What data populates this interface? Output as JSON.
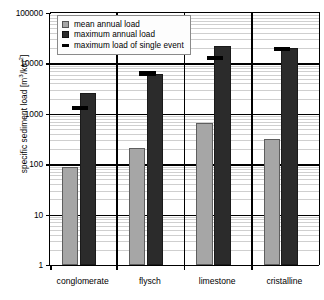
{
  "chart_data": {
    "type": "bar",
    "title": "",
    "xlabel": "",
    "ylabel": "specific sediment load [m3/km2]",
    "ylabel_base": "specific sediment load [m",
    "ylabel_sup1": "3",
    "ylabel_mid": "/km",
    "ylabel_sup2": "2",
    "ylabel_end": "]",
    "yscale": "log",
    "ylim": [
      1,
      100000
    ],
    "ytick_labels": [
      "100000",
      "10000",
      "1000",
      "100",
      "10",
      "1"
    ],
    "ytick_values": [
      100000,
      10000,
      1000,
      100,
      10,
      1
    ],
    "grid": "horizontal-log-minor",
    "legend_position": "top-left",
    "categories": [
      "conglomerate",
      "flysch",
      "limestone",
      "cristalline"
    ],
    "series": [
      {
        "name": "mean annual load",
        "type": "bar",
        "color": "#a6a6a6",
        "values": [
          90,
          210,
          650,
          320
        ]
      },
      {
        "name": "maximum annual load",
        "type": "bar",
        "color": "#2b2b2b",
        "values": [
          2600,
          6100,
          22000,
          20000
        ]
      },
      {
        "name": "maximum load of single event",
        "type": "marker",
        "color": "#000000",
        "values": [
          1300,
          6300,
          13000,
          19000
        ]
      }
    ]
  },
  "legend": {
    "items": [
      {
        "label": "mean annual load",
        "swatch": "gray-square-swatch"
      },
      {
        "label": "maximum annual load",
        "swatch": "dark-square-swatch"
      },
      {
        "label": "maximum load of single event",
        "swatch": "black-bar-swatch"
      }
    ]
  }
}
